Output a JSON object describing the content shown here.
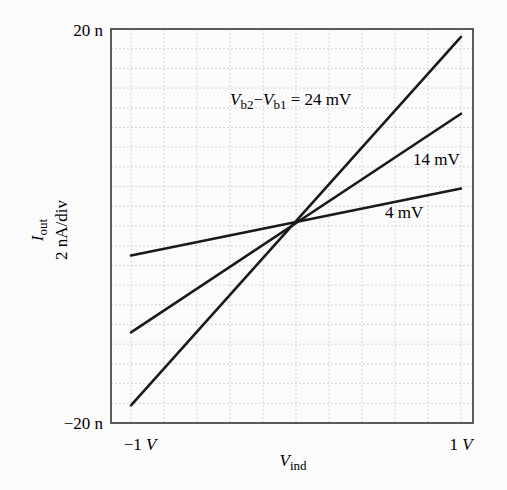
{
  "chart_data": {
    "type": "line",
    "title": "",
    "xlabel": "V_ind",
    "xlabel_main": "V",
    "xlabel_sub": "ind",
    "ylabel": "I_out",
    "ylabel_main": "I",
    "ylabel_sub": "out",
    "ylabel_scale": "2 nA/div",
    "xlim": [
      -1,
      1
    ],
    "ylim": [
      -20,
      20
    ],
    "y_units": "nA",
    "x_units": "V",
    "x_tick_labels": {
      "left": "−1 V",
      "right": "1 V",
      "left_num": "−1 ",
      "right_num": "1 ",
      "unit": "V"
    },
    "y_tick_labels": {
      "top": "20 n",
      "bottom": "−20 n"
    },
    "grid": true,
    "grid_style": "dotted",
    "x_divisions": 10,
    "y_divisions": 20,
    "x": [
      -1,
      1
    ],
    "series": [
      {
        "name": "24 mV",
        "values": [
          -18.2,
          19.2
        ]
      },
      {
        "name": "14 mV",
        "values": [
          -10.8,
          11.4
        ]
      },
      {
        "name": "4 mV",
        "values": [
          -3.0,
          3.8
        ]
      }
    ],
    "annotations": [
      {
        "text": "V_b2 − V_b1 = 24 mV",
        "series": "24 mV"
      },
      {
        "text": "14 mV",
        "series": "14 mV"
      },
      {
        "text": "4 mV",
        "series": "4 mV"
      }
    ],
    "annotation_parts": {
      "v1": "V",
      "s1": "b2",
      "minus": "−",
      "v2": "V",
      "s2": "b1",
      "eq": " = 24 mV"
    },
    "legend": "none (inline labels)"
  }
}
